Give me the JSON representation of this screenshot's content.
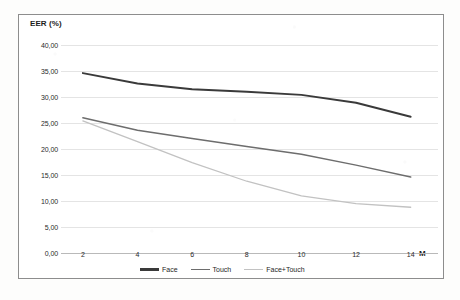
{
  "chart_data": {
    "type": "line",
    "title": "",
    "ylabel": "EER (%)",
    "xlabel": "M",
    "x": [
      2,
      4,
      6,
      8,
      10,
      12,
      14
    ],
    "xtick_labels": [
      "2",
      "4",
      "6",
      "8",
      "10",
      "12",
      "14"
    ],
    "ytick_labels": [
      "40,00",
      "35,00",
      "30,00",
      "25,00",
      "20,00",
      "15,00",
      "10,00",
      "5,00",
      "0,00"
    ],
    "ytick_values": [
      40.0,
      35.0,
      30.0,
      25.0,
      20.0,
      15.0,
      10.0,
      5.0,
      0.0
    ],
    "ylim": [
      0.0,
      40.0
    ],
    "xlim": [
      1.2,
      15.0
    ],
    "grid": true,
    "legend_position": "bottom",
    "series": [
      {
        "name": "Face",
        "color": "#3a3a3a",
        "values": [
          34.6,
          32.6,
          31.5,
          31.0,
          30.4,
          28.9,
          26.2
        ]
      },
      {
        "name": "Touch",
        "color": "#6d6d6d",
        "values": [
          26.0,
          23.6,
          22.0,
          20.5,
          19.0,
          16.9,
          14.6
        ]
      },
      {
        "name": "Face+Touch",
        "color": "#c2c2c2",
        "values": [
          25.4,
          21.4,
          17.4,
          13.8,
          11.0,
          9.5,
          8.8
        ]
      }
    ]
  },
  "legend": {
    "items": [
      {
        "label": "Face",
        "color": "#3a3a3a"
      },
      {
        "label": "Touch",
        "color": "#6d6d6d"
      },
      {
        "label": "Face+Touch",
        "color": "#c2c2c2"
      }
    ]
  },
  "axes": {
    "y_title": "EER (%)",
    "x_title": "M"
  }
}
